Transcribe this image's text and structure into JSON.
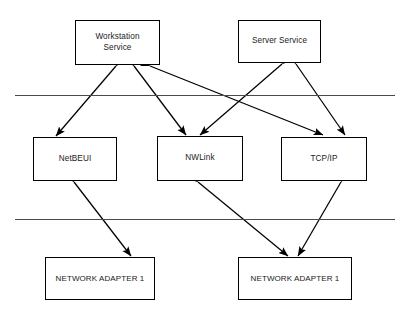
{
  "diagram": {
    "background_color": "#ffffff",
    "line_color": "#000000",
    "divider_color": "#4a4a4a",
    "text_color": "#1a1a1a",
    "nodes": {
      "workstation_service": "Workstation\nService",
      "server_service": "Server Service",
      "netbeui": "NetBEUI",
      "nwlink": "NWLink",
      "tcpip": "TCP/IP",
      "adapter_left": "NETWORK ADAPTER 1",
      "adapter_right": "NETWORK ADAPTER 1"
    },
    "layers": [
      {
        "name": "service-layer-divider",
        "y": 95
      },
      {
        "name": "adapter-layer-divider",
        "y": 219
      }
    ],
    "connections": [
      {
        "from": "workstation_service",
        "to": "netbeui",
        "style": "double-arrow"
      },
      {
        "from": "workstation_service",
        "to": "nwlink",
        "style": "double-arrow"
      },
      {
        "from": "workstation_service",
        "to": "tcpip",
        "style": "double-arrow"
      },
      {
        "from": "server_service",
        "to": "nwlink",
        "style": "double-arrow"
      },
      {
        "from": "server_service",
        "to": "tcpip",
        "style": "double-arrow"
      },
      {
        "from": "netbeui",
        "to": "adapter_left",
        "style": "double-arrow"
      },
      {
        "from": "nwlink",
        "to": "adapter_right",
        "style": "double-arrow"
      },
      {
        "from": "tcpip",
        "to": "adapter_right",
        "style": "double-arrow"
      }
    ]
  }
}
